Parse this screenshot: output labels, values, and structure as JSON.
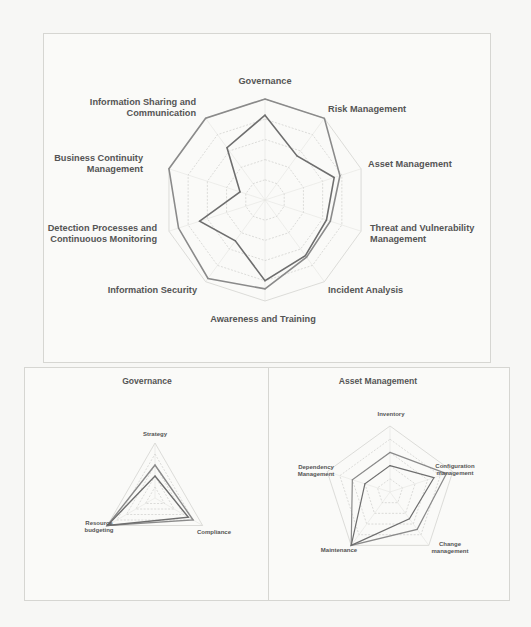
{
  "colors": {
    "background": "#f7f7f5",
    "series_outer": "#8a8a8a",
    "series_inner": "#6e6e6e",
    "grid": "#d3d3d0",
    "label": "#555555"
  },
  "chart_data": [
    {
      "type": "radar",
      "title": "",
      "axes": [
        "Governance",
        "Risk Management",
        "Asset Management",
        "Threat and Vulnerability Management",
        "Incident Analysis",
        "Awareness and Training",
        "Information Security",
        "Detection Processes and Continuouos Monitoring",
        "Business Continuity Management",
        "Information Sharing and Communication"
      ],
      "axis_label_lines": [
        [
          "Governance"
        ],
        [
          "Risk Management"
        ],
        [
          "Asset Management"
        ],
        [
          "Threat and Vulnerability",
          "Management"
        ],
        [
          "Incident Analysis"
        ],
        [
          "Awareness and Training"
        ],
        [
          "Information Security"
        ],
        [
          "Detection Processes and",
          "Continuouos Monitoring"
        ],
        [
          "Business Continuity",
          "Management"
        ],
        [
          "Information Sharing and",
          "Communication"
        ]
      ],
      "range": [
        0,
        5
      ],
      "grid_levels": 5,
      "legend": "none",
      "series": [
        {
          "name": "Series 1 (outer)",
          "values": [
            5.0,
            5.0,
            3.9,
            3.4,
            3.5,
            4.4,
            4.8,
            4.5,
            5.0,
            5.0
          ]
        },
        {
          "name": "Series 2 (inner)",
          "values": [
            4.2,
            2.7,
            3.6,
            3.2,
            3.4,
            4.0,
            2.5,
            3.4,
            1.3,
            3.2
          ]
        }
      ]
    },
    {
      "type": "radar",
      "title": "Governance",
      "axes": [
        "Strategy",
        "Compliance",
        "Resource budgeting"
      ],
      "axis_label_lines": [
        [
          "Strategy"
        ],
        [
          "Compliance"
        ],
        [
          "Resource",
          "budgeting"
        ]
      ],
      "range": [
        0,
        5
      ],
      "grid_levels": 5,
      "legend": "none",
      "series": [
        {
          "name": "Series 1 (outer)",
          "values": [
            3.0,
            4.0,
            5.0
          ]
        },
        {
          "name": "Series 2 (inner)",
          "values": [
            2.0,
            3.5,
            5.0
          ]
        }
      ]
    },
    {
      "type": "radar",
      "title": "Asset Management",
      "axes": [
        "Inventory",
        "Configuration management",
        "Change management",
        "Maintenance",
        "Dependency Management"
      ],
      "axis_label_lines": [
        [
          "Inventory"
        ],
        [
          "Configuration",
          "management"
        ],
        [
          "Change",
          "management"
        ],
        [
          "Maintenance"
        ],
        [
          "Dependency",
          "Management"
        ]
      ],
      "range": [
        0,
        5
      ],
      "grid_levels": 5,
      "legend": "none",
      "series": [
        {
          "name": "Series 1 (outer)",
          "values": [
            3.0,
            4.5,
            3.5,
            5.0,
            3.0
          ]
        },
        {
          "name": "Series 2 (inner)",
          "values": [
            2.0,
            3.5,
            2.5,
            5.0,
            2.0
          ]
        }
      ]
    }
  ]
}
